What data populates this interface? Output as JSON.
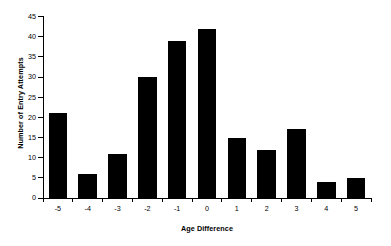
{
  "chart_data": {
    "type": "bar",
    "title": "",
    "xlabel": "Age Difference",
    "ylabel": "Number of Entry Attempts",
    "categories": [
      "-5",
      "-4",
      "-3",
      "-2",
      "-1",
      "0",
      "1",
      "2",
      "3",
      "4",
      "5"
    ],
    "values": [
      21,
      6,
      11,
      30,
      39,
      42,
      15,
      12,
      17,
      4,
      5
    ],
    "ylim": [
      0,
      45
    ],
    "yticks": [
      0,
      5,
      10,
      15,
      20,
      25,
      30,
      35,
      40,
      45
    ],
    "ytick_labels": [
      "0",
      "5",
      "10",
      "15",
      "20",
      "25",
      "30",
      "35",
      "40",
      "45"
    ],
    "grid": false,
    "legend": null,
    "bar_color": "#000000",
    "background_color": "#ffffff",
    "axis_color": "#000000"
  }
}
